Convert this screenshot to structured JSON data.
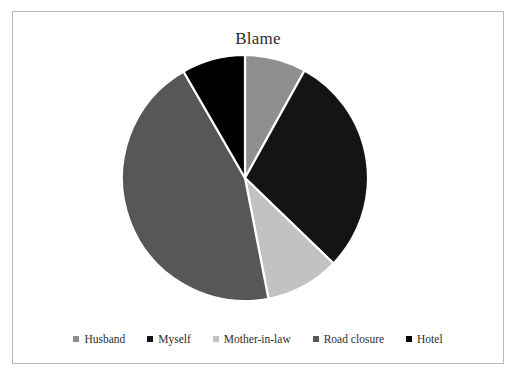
{
  "chart": {
    "title": "Blame",
    "frame_border_color": "#b9b9b9",
    "background": "#ffffff",
    "slice_separator_color": "#ffffff"
  },
  "chart_data": {
    "type": "pie",
    "title": "Blame",
    "xlabel": "",
    "ylabel": "",
    "legend_position": "bottom",
    "grid": false,
    "start_angle_deg": 0,
    "direction": "clockwise",
    "categories": [
      "Husband",
      "Myself",
      "Mother-in-law",
      "Road closure",
      "Hotel"
    ],
    "values": [
      8,
      29,
      10,
      45,
      8
    ],
    "percentages": [
      8,
      29,
      10,
      45,
      8
    ],
    "angles_deg": [
      29,
      105,
      35,
      161,
      30
    ],
    "colors": [
      "#8f8f8f",
      "#141414",
      "#c2c2c2",
      "#575757",
      "#000000"
    ],
    "slices": [
      {
        "label": "Husband",
        "value": 8,
        "percent": 8,
        "angle_deg": 29,
        "color": "#8f8f8f"
      },
      {
        "label": "Myself",
        "value": 29,
        "percent": 29,
        "angle_deg": 105,
        "color": "#141414"
      },
      {
        "label": "Mother-in-law",
        "value": 10,
        "percent": 10,
        "angle_deg": 35,
        "color": "#c2c2c2"
      },
      {
        "label": "Road closure",
        "value": 45,
        "percent": 45,
        "angle_deg": 161,
        "color": "#575757"
      },
      {
        "label": "Hotel",
        "value": 8,
        "percent": 8,
        "angle_deg": 30,
        "color": "#000000"
      }
    ]
  },
  "legend": {
    "items": [
      {
        "label": "Husband",
        "color": "#8f8f8f",
        "marker": "square-marker"
      },
      {
        "label": "Myself",
        "color": "#141414",
        "marker": "square-marker"
      },
      {
        "label": "Mother-in-law",
        "color": "#c2c2c2",
        "marker": "square-marker"
      },
      {
        "label": "Road closure",
        "color": "#575757",
        "marker": "square-marker"
      },
      {
        "label": "Hotel",
        "color": "#000000",
        "marker": "square-marker"
      }
    ]
  }
}
